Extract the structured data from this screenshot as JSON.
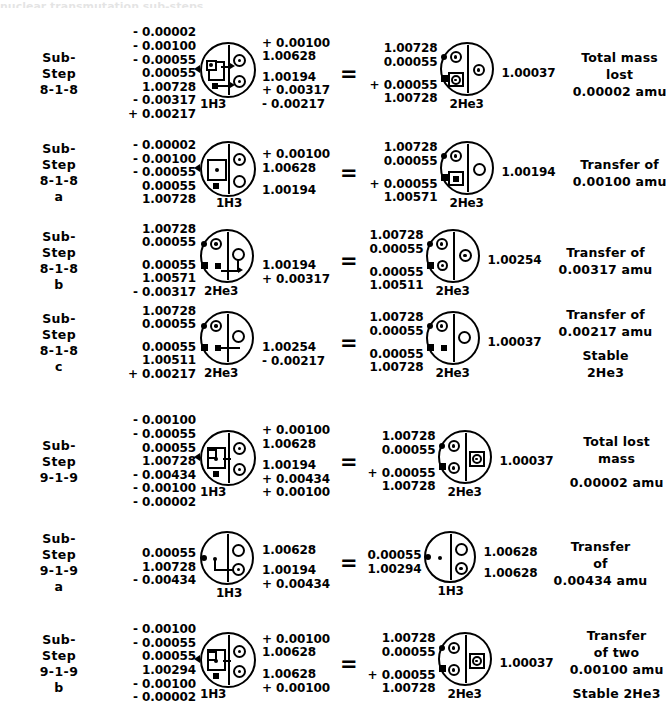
{
  "page": {
    "cropped_header_fragment": "nuclear transmutation sub-steps"
  },
  "rows": [
    {
      "id": "sub-step-8-1-8",
      "step_lines": [
        "Sub-",
        "Step",
        "8-1-8",
        ""
      ],
      "left_nums": [
        "- 0.00002",
        "- 0.00100",
        "- 0.00055",
        "0.00055",
        "1.00728",
        "- 0.00317",
        "+ 0.00217"
      ],
      "left_atom": {
        "label": "1H3",
        "variant": "h3-boxed-arrows",
        "right_nums": [
          "+ 0.00100",
          "1.00628",
          "1.00194",
          "+ 0.00317",
          "- 0.00217"
        ]
      },
      "equals": "=",
      "right_nums": [
        "1.00728",
        "0.00055",
        "+ 0.00055",
        "1.00728"
      ],
      "right_atom": {
        "label": "2He3",
        "variant": "he3-box-lower"
      },
      "right_total": "1.00037",
      "result_lines": [
        "Total mass",
        "lost",
        "0.00002 amu"
      ]
    },
    {
      "id": "sub-step-8-1-8-a",
      "step_lines": [
        "Sub-",
        "Step",
        "8-1-8",
        "a"
      ],
      "left_nums": [
        "- 0.00002",
        "- 0.00100",
        "- 0.00055",
        "0.00055",
        "1.00728"
      ],
      "left_atom": {
        "label": "1H3",
        "variant": "h3-box-open",
        "right_nums": [
          "+ 0.00100",
          "1.00628",
          "1.00194"
        ]
      },
      "equals": "=",
      "right_nums": [
        "1.00728",
        "0.00055",
        "+ 0.00055",
        "1.00571"
      ],
      "right_atom": {
        "label": "2He3",
        "variant": "he3-box-open"
      },
      "right_total": "1.00194",
      "result_lines": [
        "Transfer of",
        "0.00100 amu"
      ]
    },
    {
      "id": "sub-step-8-1-8-b",
      "step_lines": [
        "Sub-",
        "Step",
        "8-1-8",
        "b"
      ],
      "left_nums": [
        "1.00728",
        "0.00055",
        "0.00055",
        "1.00571",
        "- 0.00317"
      ],
      "left_atom": {
        "label": "2He3",
        "variant": "he3-arrow-open",
        "right_nums": [
          "1.00194",
          "+ 0.00317"
        ]
      },
      "equals": "=",
      "right_nums": [
        "1.00728",
        "0.00055",
        "0.00055",
        "1.00511"
      ],
      "right_atom": {
        "label": "2He3",
        "variant": "he3-two-dots"
      },
      "right_total": "1.00254",
      "result_lines": [
        "Transfer of",
        "0.00317 amu"
      ]
    },
    {
      "id": "sub-step-8-1-8-c",
      "step_lines": [
        "Sub-",
        "Step",
        "8-1-8",
        "c"
      ],
      "left_nums": [
        "1.00728",
        "0.00055",
        "0.00055",
        "1.00511",
        "+ 0.00217"
      ],
      "left_atom": {
        "label": "2He3",
        "variant": "he3-arrow-open2",
        "right_nums": [
          "1.00254",
          "- 0.00217"
        ]
      },
      "equals": "=",
      "right_nums": [
        "1.00728",
        "0.00055",
        "0.00055",
        "1.00728"
      ],
      "right_atom": {
        "label": "2He3",
        "variant": "he3-open-final"
      },
      "right_total": "1.00037",
      "result_lines": [
        "Transfer of",
        "0.00217 amu",
        "",
        "Stable",
        "2He3"
      ]
    },
    {
      "id": "sub-step-9-1-9",
      "step_lines": [
        "Sub-",
        "Step",
        "9-1-9",
        ""
      ],
      "left_nums": [
        "- 0.00100",
        "- 0.00055",
        "0.00055",
        "1.00728",
        "- 0.00434",
        "- 0.00100",
        "- 0.00002"
      ],
      "left_atom": {
        "label": "1H3",
        "variant": "h3-boxed-two",
        "right_nums": [
          "+ 0.00100",
          "1.00628",
          "1.00194",
          "+ 0.00434",
          "+ 0.00100"
        ]
      },
      "equals": "=",
      "right_nums": [
        "1.00728",
        "0.00055",
        "+ 0.00055",
        "1.00728"
      ],
      "right_atom": {
        "label": "2He3",
        "variant": "he3-boxed-right"
      },
      "right_total": "1.00037",
      "result_lines": [
        "Total lost",
        "mass",
        "0.00002 amu"
      ]
    },
    {
      "id": "sub-step-9-1-9-a",
      "step_lines": [
        "Sub-",
        "Step",
        "9-1-9",
        "a"
      ],
      "left_nums": [
        "0.00055",
        "1.00728",
        "- 0.00434"
      ],
      "left_atom": {
        "label": "1H3",
        "variant": "h3-small-arrow",
        "right_nums": [
          "1.00628",
          "1.00194",
          "+ 0.00434"
        ]
      },
      "equals": "=",
      "right_nums": [
        "0.00055",
        "1.00294"
      ],
      "right_atom": {
        "label": "1H3",
        "variant": "h3-small-plain",
        "right_nums": [
          "1.00628",
          "1.00628"
        ]
      },
      "right_total": "",
      "result_lines": [
        "Transfer",
        "of",
        "0.00434 amu"
      ]
    },
    {
      "id": "sub-step-9-1-9-b",
      "step_lines": [
        "Sub-",
        "Step",
        "9-1-9",
        "b"
      ],
      "left_nums": [
        "- 0.00100",
        "- 0.00055",
        "0.00055",
        "1.00294",
        "- 0.00100",
        "- 0.00002"
      ],
      "left_atom": {
        "label": "1H3",
        "variant": "h3-boxed-two-b",
        "right_nums": [
          "+ 0.00100",
          "1.00628",
          "1.00628",
          "+ 0.00100"
        ]
      },
      "equals": "=",
      "right_nums": [
        "1.00728",
        "0.00055",
        "+ 0.00055",
        "1.00728"
      ],
      "right_atom": {
        "label": "2He3",
        "variant": "he3-boxed-right"
      },
      "right_total": "1.00037",
      "result_lines": [
        "Transfer",
        "of two",
        "0.00100 amu",
        "",
        "Stable 2He3"
      ]
    }
  ]
}
